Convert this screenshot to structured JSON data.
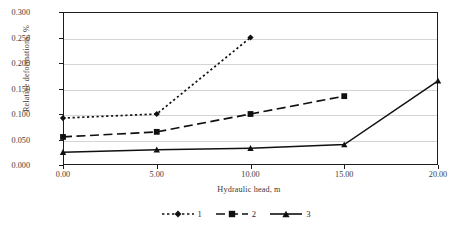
{
  "chart_data": {
    "type": "line",
    "title": "",
    "xlabel": "Hydraulic head, m",
    "ylabel": "Relative deformations, %",
    "xlim": [
      0,
      20
    ],
    "ylim": [
      0,
      0.3
    ],
    "grid": "horizontal",
    "legend_position": "bottom",
    "xticks": [
      "0.00",
      "5.00",
      "10.00",
      "15.00",
      "20.00"
    ],
    "xtick_values": [
      0,
      5,
      10,
      15,
      20
    ],
    "yticks": [
      "0.000",
      "0.050",
      "0.100",
      "0.150",
      "0.200",
      "0.250",
      "0.300"
    ],
    "ytick_values": [
      0.0,
      0.05,
      0.1,
      0.15,
      0.2,
      0.25,
      0.3
    ],
    "series": [
      {
        "name": "1",
        "style": "dotted",
        "marker": "diamond",
        "color": "#101010",
        "x": [
          0,
          5,
          10
        ],
        "values": [
          0.092,
          0.1,
          0.25
        ]
      },
      {
        "name": "2",
        "style": "dashed",
        "marker": "square",
        "color": "#101010",
        "x": [
          0,
          5,
          10,
          15
        ],
        "values": [
          0.055,
          0.065,
          0.1,
          0.135
        ]
      },
      {
        "name": "3",
        "style": "solid",
        "marker": "triangle",
        "color": "#101010",
        "x": [
          0,
          5,
          10,
          15,
          20
        ],
        "values": [
          0.025,
          0.03,
          0.033,
          0.04,
          0.165
        ]
      }
    ]
  },
  "legend": {
    "entries": [
      {
        "label": "1"
      },
      {
        "label": "2"
      },
      {
        "label": "3"
      }
    ]
  }
}
